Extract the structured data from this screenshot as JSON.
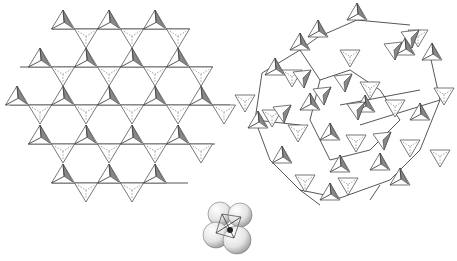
{
  "figure": {
    "title": "",
    "panels": [
      {
        "id": "ordered-network",
        "description": "ordered kagome net of corner-sharing tetrahedra"
      },
      {
        "id": "disordered-network",
        "description": "disordered network of corner-sharing tetrahedra"
      },
      {
        "id": "tetrahedron-model",
        "description": "space-filling model of a single tetrahedron"
      }
    ],
    "colors": {
      "line": "#444444",
      "shade": "#888888",
      "sphere_light": "#ffffff",
      "sphere_dark": "#b8b8b8",
      "center_atom": "#222222"
    }
  },
  "kagome": {
    "lines": [
      {
        "y": 29,
        "x1": 52,
        "x2": 190
      },
      {
        "y": 67,
        "x1": 20,
        "x2": 213
      },
      {
        "y": 105,
        "x1": 10,
        "x2": 230
      },
      {
        "y": 144,
        "x1": 28,
        "x2": 215
      },
      {
        "y": 183,
        "x1": 52,
        "x2": 188
      }
    ],
    "half": 11.5,
    "h": 19,
    "up": [
      [
        63,
        29
      ],
      [
        109,
        29
      ],
      [
        155,
        29
      ],
      [
        40,
        67
      ],
      [
        86,
        67
      ],
      [
        132,
        67
      ],
      [
        178,
        67
      ],
      [
        17,
        105
      ],
      [
        63,
        105
      ],
      [
        109,
        105
      ],
      [
        155,
        105
      ],
      [
        201,
        105
      ],
      [
        40,
        144
      ],
      [
        86,
        144
      ],
      [
        132,
        144
      ],
      [
        178,
        144
      ],
      [
        63,
        183
      ],
      [
        109,
        183
      ],
      [
        155,
        183
      ]
    ],
    "down": [
      [
        86,
        29
      ],
      [
        132,
        29
      ],
      [
        178,
        29
      ],
      [
        63,
        67
      ],
      [
        109,
        67
      ],
      [
        155,
        67
      ],
      [
        201,
        67
      ],
      [
        40,
        105
      ],
      [
        86,
        105
      ],
      [
        132,
        105
      ],
      [
        178,
        105
      ],
      [
        224,
        105
      ],
      [
        63,
        144
      ],
      [
        109,
        144
      ],
      [
        155,
        144
      ],
      [
        201,
        144
      ],
      [
        86,
        183
      ],
      [
        132,
        183
      ]
    ]
  },
  "disordered": {
    "edges": [
      [
        262,
        73,
        300,
        50
      ],
      [
        300,
        50,
        318,
        37
      ],
      [
        318,
        37,
        357,
        20
      ],
      [
        357,
        20,
        410,
        25
      ],
      [
        262,
        73,
        255,
        120
      ],
      [
        255,
        120,
        270,
        160
      ],
      [
        270,
        160,
        300,
        190
      ],
      [
        300,
        190,
        340,
        198
      ],
      [
        340,
        198,
        390,
        180
      ],
      [
        390,
        180,
        420,
        150
      ],
      [
        420,
        150,
        440,
        100
      ],
      [
        440,
        100,
        430,
        55
      ],
      [
        300,
        50,
        320,
        80
      ],
      [
        320,
        80,
        310,
        120
      ],
      [
        310,
        120,
        330,
        160
      ],
      [
        330,
        160,
        370,
        150
      ],
      [
        370,
        150,
        400,
        120
      ],
      [
        400,
        120,
        380,
        90
      ],
      [
        380,
        90,
        350,
        70
      ],
      [
        350,
        70,
        320,
        80
      ],
      [
        340,
        105,
        420,
        90
      ],
      [
        360,
        125,
        440,
        100
      ],
      [
        255,
        120,
        300,
        125
      ],
      [
        300,
        190,
        320,
        205
      ],
      [
        380,
        185,
        370,
        200
      ]
    ],
    "up": [
      [
        275,
        75
      ],
      [
        318,
        37
      ],
      [
        357,
        20
      ],
      [
        405,
        55
      ],
      [
        432,
        60
      ],
      [
        300,
        50
      ],
      [
        310,
        110
      ],
      [
        330,
        140
      ],
      [
        258,
        128
      ],
      [
        282,
        163
      ],
      [
        340,
        172
      ],
      [
        380,
        170
      ],
      [
        400,
        185
      ],
      [
        330,
        200
      ],
      [
        420,
        120
      ],
      [
        365,
        112
      ]
    ],
    "down": [
      [
        292,
        70
      ],
      [
        350,
        50
      ],
      [
        418,
        30
      ],
      [
        444,
        88
      ],
      [
        272,
        110
      ],
      [
        298,
        125
      ],
      [
        356,
        135
      ],
      [
        305,
        175
      ],
      [
        395,
        100
      ],
      [
        440,
        150
      ],
      [
        370,
        82
      ],
      [
        410,
        140
      ],
      [
        245,
        95
      ],
      [
        348,
        178
      ]
    ],
    "shaded_small": [
      [
        302,
        78
      ],
      [
        343,
        82
      ],
      [
        393,
        50
      ],
      [
        322,
        95
      ],
      [
        356,
        110
      ],
      [
        410,
        38
      ],
      [
        282,
        113
      ],
      [
        382,
        140
      ]
    ]
  },
  "model": {
    "spheres": [
      {
        "cx": 220,
        "cy": 214,
        "r": 12
      },
      {
        "cx": 240,
        "cy": 215,
        "r": 12
      },
      {
        "cx": 216,
        "cy": 235,
        "r": 13
      },
      {
        "cx": 237,
        "cy": 240,
        "r": 14
      }
    ],
    "center": {
      "cx": 230,
      "cy": 230,
      "r": 3
    }
  }
}
